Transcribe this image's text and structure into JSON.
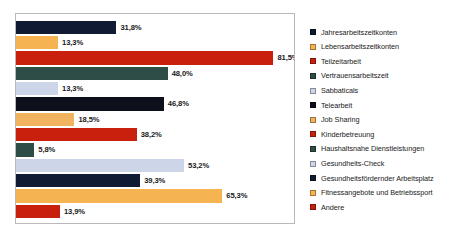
{
  "chart_data": {
    "type": "bar",
    "orientation": "horizontal",
    "title": "",
    "xlabel": "",
    "ylabel": "",
    "xlim": [
      0,
      88
    ],
    "grid": false,
    "legend_position": "right",
    "value_suffix": "%",
    "decimal_separator": ",",
    "categories": [
      "Jahresarbeitszeitkonten",
      "Lebensarbeitszeitkonten",
      "Teilzeitarbeit",
      "Vertrauensarbeitszeit",
      "Sabbaticals",
      "Telearbeit",
      "Job Sharing",
      "Kinderbetreuung",
      "Haushaltsnahe Dienstleistungen",
      "Gesundheits-Check",
      "Gesundheitsfördernder Arbeitsplatz",
      "Fitnessangebote und Betriebssport",
      "Andere"
    ],
    "values": [
      31.8,
      13.3,
      81.5,
      48.0,
      13.3,
      46.8,
      18.5,
      38.2,
      5.8,
      53.2,
      39.3,
      65.3,
      13.9
    ],
    "data_labels": [
      "31,8%",
      "13,3%",
      "81,5%",
      "48,0%",
      "13,3%",
      "46,8%",
      "18,5%",
      "38,2%",
      "5,8%",
      "53,2%",
      "39,3%",
      "65,3%",
      "13,9%"
    ],
    "colors": [
      "#111a33",
      "#f5b351",
      "#c8200d",
      "#2e4d46",
      "#ccd6e8",
      "#0d0f1a",
      "#f0b45e",
      "#c8200d",
      "#2e4d46",
      "#ccd6e8",
      "#111a33",
      "#f5b351",
      "#c8200d"
    ]
  },
  "legend": {
    "items": [
      {
        "label": "Jahresarbeitszeitkonten",
        "color": "#111a33"
      },
      {
        "label": "Lebensarbeitszeitkonten",
        "color": "#f5b351"
      },
      {
        "label": "Teilzeitarbeit",
        "color": "#c8200d"
      },
      {
        "label": "Vertrauensarbeitszeit",
        "color": "#2e4d46"
      },
      {
        "label": "Sabbaticals",
        "color": "#ccd6e8"
      },
      {
        "label": "Telearbeit",
        "color": "#0d0f1a"
      },
      {
        "label": "Job Sharing",
        "color": "#f0b45e"
      },
      {
        "label": "Kinderbetreuung",
        "color": "#c8200d"
      },
      {
        "label": "Haushaltsnahe Dienstleistungen",
        "color": "#2e4d46"
      },
      {
        "label": "Gesundheits-Check",
        "color": "#ccd6e8"
      },
      {
        "label": "Gesundheitsfördernder Arbeitsplatz",
        "color": "#111a33"
      },
      {
        "label": "Fitnessangebote und Betriebssport",
        "color": "#f5b351"
      },
      {
        "label": "Andere",
        "color": "#c8200d"
      }
    ]
  }
}
